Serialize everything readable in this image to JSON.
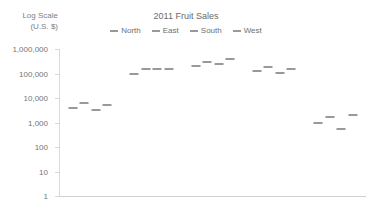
{
  "chart_data": {
    "type": "scatter",
    "title": "2011 Fruit Sales",
    "ylabel_line1": "Log Scale",
    "ylabel_line2": "(U.S. $)",
    "xlabel": "",
    "scale": "log",
    "grid": false,
    "legend_position": "top-center",
    "categories": [
      "Mangoes",
      "Peaches",
      "Apples",
      "Pears",
      "Guavas"
    ],
    "y_ticks": [
      1,
      10,
      100,
      1000,
      10000,
      100000,
      1000000
    ],
    "y_tick_labels": [
      "1",
      "10",
      "100",
      "1,000",
      "10,000",
      "100,000",
      "1,000,000"
    ],
    "ylim": [
      1,
      1000000
    ],
    "series": [
      {
        "name": "North",
        "values": [
          4000,
          100000,
          200000,
          130000,
          1000
        ]
      },
      {
        "name": "East",
        "values": [
          6500,
          150000,
          300000,
          180000,
          1600
        ]
      },
      {
        "name": "South",
        "values": [
          3200,
          150000,
          250000,
          105000,
          550
        ]
      },
      {
        "name": "West",
        "values": [
          5000,
          150000,
          400000,
          150000,
          2100
        ]
      }
    ],
    "marker_color": "#999999"
  }
}
